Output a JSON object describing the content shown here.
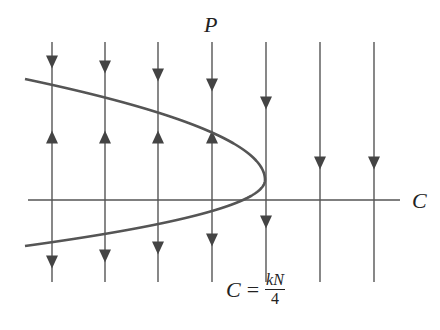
{
  "figure": {
    "type": "phase-line-diagram",
    "y_axis_label": "P",
    "x_axis_label": "C",
    "equation": {
      "lhs": "C",
      "operator": "=",
      "numerator": "kN",
      "denominator": "4",
      "full": "C = kN/4"
    },
    "colors": {
      "line": "#555555",
      "curve": "#555555",
      "arrow": "#444444",
      "text": "#222222"
    }
  },
  "chart_data": {
    "type": "diagram",
    "title": "",
    "xlabel": "C",
    "ylabel": "P",
    "axis": {
      "y_px": 200,
      "x_from": 28,
      "x_to": 400
    },
    "curve": {
      "shape": "parabola opening left",
      "vertex_px": [
        265,
        180
      ],
      "upper_end_px": [
        25,
        79
      ],
      "lower_end_px": [
        25,
        246
      ]
    },
    "vertical_lines": [
      {
        "x": 52,
        "arrows": [
          {
            "y": 62,
            "dir": "down"
          },
          {
            "y": 137,
            "dir": "up"
          },
          {
            "y": 262,
            "dir": "down"
          }
        ]
      },
      {
        "x": 105,
        "arrows": [
          {
            "y": 67,
            "dir": "down"
          },
          {
            "y": 137,
            "dir": "up"
          },
          {
            "y": 256,
            "dir": "down"
          }
        ]
      },
      {
        "x": 158,
        "arrows": [
          {
            "y": 75,
            "dir": "down"
          },
          {
            "y": 137,
            "dir": "up"
          },
          {
            "y": 248,
            "dir": "down"
          }
        ]
      },
      {
        "x": 212,
        "arrows": [
          {
            "y": 85,
            "dir": "down"
          },
          {
            "y": 137,
            "dir": "up"
          },
          {
            "y": 240,
            "dir": "down"
          }
        ]
      },
      {
        "x": 266,
        "arrows": [
          {
            "y": 103,
            "dir": "down"
          },
          {
            "y": 222,
            "dir": "down"
          }
        ]
      },
      {
        "x": 320,
        "arrows": [
          {
            "y": 163,
            "dir": "down"
          }
        ]
      },
      {
        "x": 374,
        "arrows": [
          {
            "y": 163,
            "dir": "down"
          }
        ]
      }
    ],
    "line_top_y": 42,
    "line_bottom_y": 282,
    "annotation": "C = kN/4"
  }
}
